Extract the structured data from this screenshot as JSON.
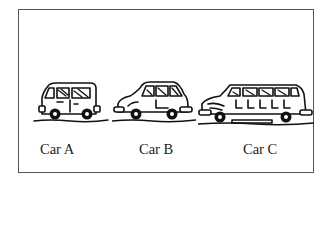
{
  "figure": {
    "cars": [
      {
        "id": "A",
        "label": "Car A",
        "type": "small van"
      },
      {
        "id": "B",
        "label": "Car B",
        "type": "hatchback"
      },
      {
        "id": "C",
        "label": "Car C",
        "type": "limousine"
      }
    ]
  },
  "colors": {
    "ink": "#111111",
    "frame": "#555555",
    "background": "#ffffff"
  }
}
